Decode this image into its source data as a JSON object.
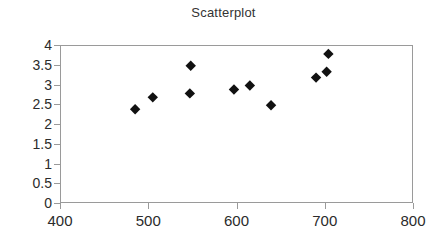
{
  "chart_data": {
    "type": "scatter",
    "title": "Scatterplot",
    "xlabel": "",
    "ylabel": "",
    "xlim": [
      400,
      800
    ],
    "ylim": [
      0,
      4
    ],
    "xticks": [
      400,
      500,
      600,
      700,
      800
    ],
    "yticks": [
      0,
      0.5,
      1,
      1.5,
      2,
      2.5,
      3,
      3.5,
      4
    ],
    "xtick_labels": [
      "400",
      "500",
      "600",
      "700",
      "800"
    ],
    "ytick_labels": [
      "0",
      "0.5",
      "1",
      "1.5",
      "2",
      "2.5",
      "3",
      "3.5",
      "4"
    ],
    "grid": false,
    "legend": false,
    "legend_position": "none",
    "marker": "diamond",
    "marker_color": "#111111",
    "marker_size": 6,
    "series": [
      {
        "name": "Series 1",
        "points": [
          {
            "x": 484,
            "y": 2.4
          },
          {
            "x": 504,
            "y": 2.7
          },
          {
            "x": 546,
            "y": 2.8
          },
          {
            "x": 547,
            "y": 3.5
          },
          {
            "x": 596,
            "y": 2.9
          },
          {
            "x": 614,
            "y": 3.0
          },
          {
            "x": 638,
            "y": 2.5
          },
          {
            "x": 689,
            "y": 3.2
          },
          {
            "x": 701,
            "y": 3.35
          },
          {
            "x": 703,
            "y": 3.8
          }
        ]
      }
    ]
  },
  "style": {
    "axis_color": "#9a9a9a",
    "text_color": "#2b2b2b",
    "title_color": "#333333",
    "background": "#ffffff"
  }
}
